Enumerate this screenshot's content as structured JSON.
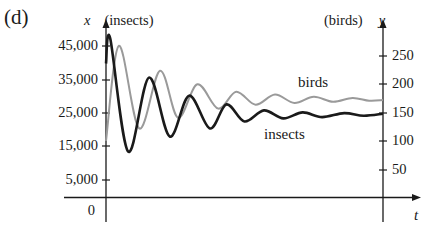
{
  "panel_label": "(d)",
  "left_axis": {
    "variable": "x",
    "title": "(insects)",
    "ticks": [
      "45,000",
      "35,000",
      "25,000",
      "15,000",
      "5,000"
    ],
    "origin": "0"
  },
  "right_axis": {
    "variable": "y",
    "title": "(birds)",
    "ticks": [
      "250",
      "200",
      "150",
      "100",
      "50"
    ]
  },
  "x_axis": {
    "variable": "t"
  },
  "series_labels": {
    "birds": "birds",
    "insects": "insects"
  },
  "colors": {
    "insects": "#1a1a1a",
    "birds": "#9a9a9a",
    "axes": "#1a1a1a"
  },
  "chart_data": {
    "type": "line",
    "title": "(d)",
    "xlabel": "t",
    "ylabel_left": "x (insects)",
    "ylabel_right": "y (birds)",
    "ylim_left": [
      0,
      50000
    ],
    "ylim_right": [
      0,
      280
    ],
    "left_ticks": [
      5000,
      15000,
      25000,
      35000,
      45000
    ],
    "right_ticks": [
      50,
      100,
      150,
      200,
      250
    ],
    "grid": false,
    "legend": "inline labels",
    "x": [
      0,
      0.015,
      0.08,
      0.155,
      0.23,
      0.3,
      0.37,
      0.435,
      0.5,
      0.57,
      0.64,
      0.72,
      0.8,
      0.88,
      0.96,
      1.0
    ],
    "series": [
      {
        "name": "insects",
        "axis": "left",
        "color": "#1a1a1a",
        "points": [
          [
            0,
            40000
          ],
          [
            0.015,
            47500
          ],
          [
            0.08,
            13700
          ],
          [
            0.155,
            35800
          ],
          [
            0.23,
            18200
          ],
          [
            0.3,
            30400
          ],
          [
            0.375,
            20600
          ],
          [
            0.435,
            27800
          ],
          [
            0.5,
            22700
          ],
          [
            0.57,
            26000
          ],
          [
            0.64,
            23600
          ],
          [
            0.71,
            25400
          ],
          [
            0.78,
            24000
          ],
          [
            0.86,
            25200
          ],
          [
            0.93,
            24400
          ],
          [
            1.0,
            25000
          ]
        ]
      },
      {
        "name": "birds",
        "axis": "right",
        "color": "#9a9a9a",
        "points": [
          [
            0,
            100
          ],
          [
            0.047,
            268
          ],
          [
            0.12,
            122
          ],
          [
            0.195,
            224
          ],
          [
            0.26,
            141
          ],
          [
            0.33,
            200
          ],
          [
            0.405,
            157
          ],
          [
            0.47,
            187
          ],
          [
            0.54,
            164
          ],
          [
            0.61,
            182
          ],
          [
            0.68,
            167
          ],
          [
            0.75,
            178
          ],
          [
            0.82,
            169
          ],
          [
            0.89,
            176
          ],
          [
            0.95,
            171
          ],
          [
            1.0,
            172
          ]
        ]
      }
    ]
  }
}
